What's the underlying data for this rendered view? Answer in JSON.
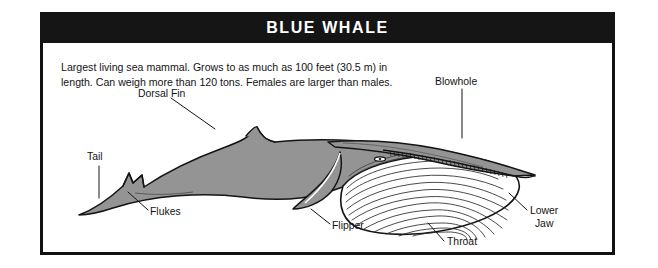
{
  "card": {
    "banner": {
      "title": "BLUE WHALE"
    },
    "description": "Largest living sea mammal. Grows to as much as 100 feet (30.5 m) in length. Can weigh more than 120 tons. Females are larger than males.",
    "facts": {
      "max_length_feet": 100,
      "max_length_meters": 30.5,
      "max_weight_tons": 120,
      "sex_size_note": "Females are larger than males."
    },
    "colors": {
      "banner_background": "#151515",
      "banner_text": "#ffffff",
      "frame": "#111111",
      "body_fill": "#949494",
      "outline": "#141414",
      "paper": "#ffffff",
      "label_text": "#141414"
    },
    "labels": [
      {
        "id": "dorsal-fin",
        "text": "Dorsal Fin"
      },
      {
        "id": "blowhole",
        "text": "Blowhole"
      },
      {
        "id": "tail",
        "text": "Tail"
      },
      {
        "id": "flukes",
        "text": "Flukes"
      },
      {
        "id": "flipper",
        "text": "Flipper"
      },
      {
        "id": "throat",
        "text": "Throat"
      },
      {
        "id": "lower-jaw",
        "text": "Lower\nJaw"
      }
    ]
  }
}
